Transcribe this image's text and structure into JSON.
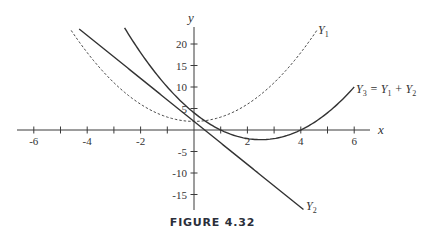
{
  "figure": {
    "caption": "FIGURE 4.32"
  },
  "chart_data": {
    "type": "line",
    "title": "",
    "xlabel": "x",
    "ylabel": "y",
    "xlim": [
      -6.6,
      6.6
    ],
    "ylim": [
      -18,
      24
    ],
    "grid": false,
    "x_ticks": [
      -6,
      -5,
      -4,
      -3,
      -2,
      -1,
      1,
      2,
      3,
      4,
      5,
      6
    ],
    "x_tick_labels": [
      {
        "value": -6,
        "label": "-6"
      },
      {
        "value": -4,
        "label": "-4"
      },
      {
        "value": -2,
        "label": "-2"
      },
      {
        "value": 2,
        "label": "2"
      },
      {
        "value": 4,
        "label": "4"
      },
      {
        "value": 6,
        "label": "6"
      }
    ],
    "y_ticks": [
      20,
      15,
      10,
      5,
      -5,
      -10,
      -15
    ],
    "y_tick_labels": [
      {
        "value": 20,
        "label": "20"
      },
      {
        "value": 15,
        "label": "15"
      },
      {
        "value": 10,
        "label": "10"
      },
      {
        "value": 5,
        "label": "5"
      },
      {
        "value": -5,
        "label": "-5"
      },
      {
        "value": -10,
        "label": "-10"
      },
      {
        "value": -15,
        "label": "-15"
      }
    ],
    "series": [
      {
        "name": "Y1",
        "label": "Y",
        "label_sub": "1",
        "style": "dashed",
        "formula": "x^2 + 2",
        "x_range": [
          -4.6,
          4.6
        ],
        "color": "#333333"
      },
      {
        "name": "Y2",
        "label": "Y",
        "label_sub": "2",
        "style": "solid",
        "formula": "2 - 5x",
        "x_range": [
          -4.3,
          4.1
        ],
        "color": "#333333"
      },
      {
        "name": "Y3",
        "label": "Y",
        "label_sub": "3",
        "label_suffix": " = Y₁ + Y₂",
        "style": "solid",
        "formula": "x^2 - 5x + 4",
        "x_range": [
          -2.6,
          6.0
        ],
        "color": "#333333"
      }
    ],
    "annotations": [
      {
        "text": "Y1",
        "near": [
          4.7,
          23
        ]
      },
      {
        "text": "Y3 = Y1 + Y2",
        "near": [
          6.1,
          10
        ]
      },
      {
        "text": "Y2",
        "near": [
          4.2,
          -18
        ]
      }
    ]
  }
}
